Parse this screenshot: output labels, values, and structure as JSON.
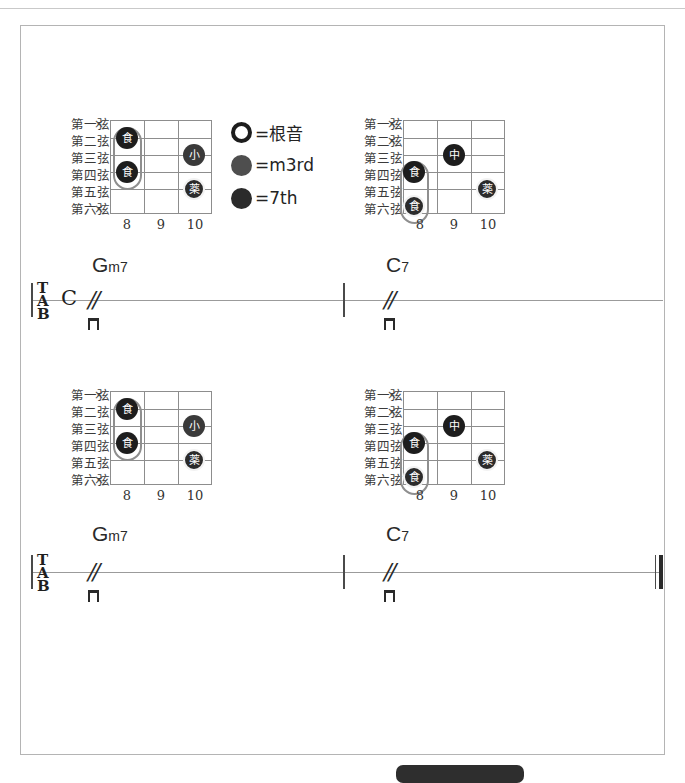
{
  "page": {
    "width": 685,
    "height": 776,
    "background": "#ffffff",
    "frame_color": "#b4b4b4"
  },
  "legend": {
    "items": [
      {
        "symbol": "hollow-circle",
        "equals": "=根音",
        "color": "#ffffff",
        "role": "root"
      },
      {
        "symbol": "filled-gray-circle",
        "equals": "=m3rd",
        "color": "#4e4e4e",
        "role": "minor-third"
      },
      {
        "symbol": "filled-dark-circle",
        "equals": "=7th",
        "color": "#2b2b2b",
        "role": "seventh"
      }
    ]
  },
  "string_labels": [
    "第一弦",
    "第二弦",
    "第三弦",
    "第四弦",
    "第五弦",
    "第六弦"
  ],
  "mute_symbol": "×",
  "systems": [
    {
      "name": "system-1",
      "clef": "TAB",
      "clef_letters": [
        "T",
        "A",
        "B"
      ],
      "time_signature": "C",
      "end_barline": "single",
      "measures": [
        {
          "chord_name": {
            "root": "G",
            "quality": "m7",
            "full": "Gm7"
          },
          "slash": "//",
          "stroke": "downstroke",
          "diagram": {
            "name": "Gm7-voicing",
            "frets": [
              "8",
              "9",
              "10"
            ],
            "muted_strings": [
              "第一弦",
              "第六弦"
            ],
            "barre": {
              "from_string": 2,
              "to_string": 4,
              "fret": 8,
              "finger": "食"
            },
            "dots": [
              {
                "string": 2,
                "fret": 8,
                "finger": "食",
                "shade": "dark"
              },
              {
                "string": 4,
                "fret": 8,
                "finger": "食",
                "shade": "dark"
              },
              {
                "string": 3,
                "fret": 10,
                "finger": "小",
                "shade": "mid"
              },
              {
                "string": 5,
                "fret": 10,
                "finger": "薬",
                "shade": "ring"
              }
            ]
          }
        },
        {
          "chord_name": {
            "root": "C",
            "quality": "7",
            "full": "C7"
          },
          "slash": "//",
          "stroke": "downstroke",
          "diagram": {
            "name": "C7-voicing",
            "frets": [
              "8",
              "9",
              "10"
            ],
            "muted_strings": [
              "第一弦",
              "第二弦"
            ],
            "barre": {
              "from_string": 4,
              "to_string": 6,
              "fret": 8,
              "finger": "食"
            },
            "dots": [
              {
                "string": 4,
                "fret": 8,
                "finger": "食",
                "shade": "dark"
              },
              {
                "string": 6,
                "fret": 8,
                "finger": "食",
                "shade": "dark"
              },
              {
                "string": 3,
                "fret": 9,
                "finger": "中",
                "shade": "dark"
              },
              {
                "string": 5,
                "fret": 10,
                "finger": "薬",
                "shade": "ring"
              }
            ]
          }
        }
      ]
    },
    {
      "name": "system-2",
      "clef": "TAB",
      "clef_letters": [
        "T",
        "A",
        "B"
      ],
      "time_signature": "",
      "end_barline": "final",
      "measures": [
        {
          "chord_name": {
            "root": "G",
            "quality": "m7",
            "full": "Gm7"
          },
          "slash": "//",
          "stroke": "downstroke",
          "diagram": {
            "name": "Gm7-voicing",
            "frets": [
              "8",
              "9",
              "10"
            ],
            "muted_strings": [
              "第一弦",
              "第六弦"
            ],
            "barre": {
              "from_string": 2,
              "to_string": 4,
              "fret": 8,
              "finger": "食"
            },
            "dots": [
              {
                "string": 2,
                "fret": 8,
                "finger": "食",
                "shade": "dark"
              },
              {
                "string": 4,
                "fret": 8,
                "finger": "食",
                "shade": "dark"
              },
              {
                "string": 3,
                "fret": 10,
                "finger": "小",
                "shade": "mid"
              },
              {
                "string": 5,
                "fret": 10,
                "finger": "薬",
                "shade": "ring"
              }
            ]
          }
        },
        {
          "chord_name": {
            "root": "C",
            "quality": "7",
            "full": "C7"
          },
          "slash": "//",
          "stroke": "downstroke",
          "diagram": {
            "name": "C7-voicing",
            "frets": [
              "8",
              "9",
              "10"
            ],
            "muted_strings": [
              "第一弦",
              "第二弦"
            ],
            "barre": {
              "from_string": 4,
              "to_string": 6,
              "fret": 8,
              "finger": "食"
            },
            "dots": [
              {
                "string": 4,
                "fret": 8,
                "finger": "食",
                "shade": "dark"
              },
              {
                "string": 6,
                "fret": 8,
                "finger": "食",
                "shade": "dark"
              },
              {
                "string": 3,
                "fret": 9,
                "finger": "中",
                "shade": "dark"
              },
              {
                "string": 5,
                "fret": 10,
                "finger": "薬",
                "shade": "ring"
              }
            ]
          }
        }
      ]
    }
  ]
}
